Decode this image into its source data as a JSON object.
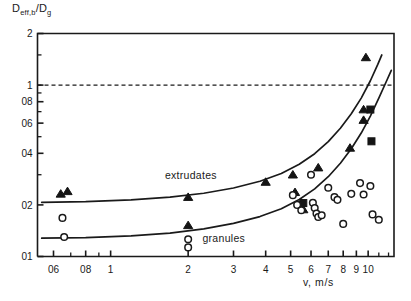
{
  "chart_data": {
    "type": "scatter",
    "title": "",
    "xlabel": "v, m/s",
    "ylabel": "D_eff,b / D_g",
    "xscale": "log",
    "yscale": "log",
    "xlim": [
      0.52,
      12.6
    ],
    "ylim": [
      0.1,
      2
    ],
    "grid": false,
    "legend": "none",
    "xticks": [
      0.6,
      0.8,
      1,
      2,
      3,
      4,
      5,
      6,
      7,
      8,
      9,
      10
    ],
    "xtick_labels": [
      "06",
      "08",
      "1",
      "2",
      "3",
      "4",
      "5",
      "6",
      "7",
      "8",
      "9",
      "10"
    ],
    "xminor_ticks": [
      0.7,
      0.9,
      11,
      12
    ],
    "yticks": [
      0.1,
      0.2,
      0.4,
      0.6,
      0.8,
      1,
      2
    ],
    "ytick_labels": [
      "01",
      "02",
      "04",
      "06",
      "08",
      "1",
      "2"
    ],
    "yminor_ticks": [
      0.3,
      0.5,
      0.7,
      0.9,
      1.5
    ],
    "reference_line": {
      "y": 1,
      "style": "dashed",
      "label": ""
    },
    "annotations": [
      {
        "text": "extrudates",
        "x": 2.05,
        "y": 0.285
      },
      {
        "text": "granules",
        "x": 2.75,
        "y": 0.122
      }
    ],
    "series": [
      {
        "name": "extrudates",
        "marker": "triangle",
        "fill": "#141414",
        "points": [
          [
            0.64,
            0.232
          ],
          [
            0.68,
            0.24
          ],
          [
            2.0,
            0.222
          ],
          [
            2.0,
            0.152
          ],
          [
            4.0,
            0.272
          ],
          [
            5.1,
            0.3
          ],
          [
            5.2,
            0.237
          ],
          [
            5.5,
            0.205
          ],
          [
            5.6,
            0.188
          ],
          [
            6.4,
            0.33
          ],
          [
            8.5,
            0.43
          ],
          [
            9.6,
            0.72
          ],
          [
            9.6,
            0.625
          ],
          [
            9.8,
            1.45
          ]
        ]
      },
      {
        "name": "extrudates-alt",
        "marker": "square",
        "fill": "#141414",
        "points": [
          [
            5.6,
            0.205
          ],
          [
            10.2,
            0.72
          ],
          [
            10.3,
            0.47
          ]
        ]
      },
      {
        "name": "granules",
        "marker": "circle",
        "fill": "none",
        "points": [
          [
            0.65,
            0.168
          ],
          [
            0.66,
            0.13
          ],
          [
            2.0,
            0.126
          ],
          [
            2.0,
            0.113
          ],
          [
            5.1,
            0.228
          ],
          [
            5.3,
            0.2
          ],
          [
            5.5,
            0.186
          ],
          [
            6.0,
            0.3
          ],
          [
            6.1,
            0.206
          ],
          [
            6.2,
            0.192
          ],
          [
            6.3,
            0.178
          ],
          [
            6.4,
            0.17
          ],
          [
            6.6,
            0.174
          ],
          [
            7.0,
            0.252
          ],
          [
            7.4,
            0.222
          ],
          [
            7.6,
            0.214
          ],
          [
            8.0,
            0.155
          ],
          [
            8.6,
            0.232
          ],
          [
            9.3,
            0.268
          ],
          [
            9.6,
            0.23
          ],
          [
            10.2,
            0.258
          ],
          [
            10.4,
            0.176
          ],
          [
            11.0,
            0.164
          ]
        ]
      }
    ],
    "curves": [
      {
        "name": "extrudates",
        "points": [
          [
            0.54,
            0.207
          ],
          [
            0.8,
            0.209
          ],
          [
            1.2,
            0.214
          ],
          [
            1.7,
            0.222
          ],
          [
            2.3,
            0.234
          ],
          [
            3.0,
            0.251
          ],
          [
            3.8,
            0.275
          ],
          [
            4.6,
            0.305
          ],
          [
            5.4,
            0.345
          ],
          [
            6.2,
            0.398
          ],
          [
            7.0,
            0.468
          ],
          [
            7.8,
            0.56
          ],
          [
            8.6,
            0.68
          ],
          [
            9.4,
            0.84
          ],
          [
            10.2,
            1.06
          ],
          [
            10.9,
            1.32
          ],
          [
            11.3,
            1.5
          ]
        ]
      },
      {
        "name": "granules",
        "points": [
          [
            0.54,
            0.128
          ],
          [
            0.8,
            0.129
          ],
          [
            1.2,
            0.132
          ],
          [
            1.7,
            0.137
          ],
          [
            2.3,
            0.145
          ],
          [
            3.0,
            0.156
          ],
          [
            3.8,
            0.171
          ],
          [
            4.6,
            0.19
          ],
          [
            5.4,
            0.215
          ],
          [
            6.2,
            0.248
          ],
          [
            7.0,
            0.292
          ],
          [
            7.8,
            0.35
          ],
          [
            8.6,
            0.425
          ],
          [
            9.4,
            0.525
          ],
          [
            10.2,
            0.66
          ],
          [
            11.0,
            0.84
          ],
          [
            11.8,
            1.06
          ],
          [
            12.3,
            1.22
          ]
        ]
      }
    ]
  },
  "axes": {
    "ylabel_main": "D",
    "ylabel_sub1": "eff,b",
    "ylabel_div": "/D",
    "ylabel_sub2": "g",
    "xlabel": "v, m/s"
  }
}
